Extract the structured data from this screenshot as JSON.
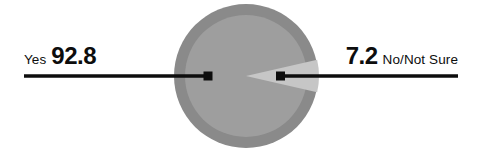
{
  "chart_data": {
    "type": "pie",
    "title": "",
    "categories": [
      "Yes",
      "No/Not Sure"
    ],
    "values": [
      92.8,
      7.2
    ],
    "value_labels": [
      "92.8",
      "7.2"
    ],
    "units": "percent",
    "legend": "none",
    "grid": false,
    "series": [
      {
        "name": "Response share",
        "values": [
          92.8,
          7.2
        ]
      }
    ],
    "slices": [
      {
        "label": "Yes",
        "value": 92.8,
        "value_label": "92.8",
        "color": "#9e9e9e",
        "ring_color": "#8a8a8a",
        "start_angle_deg": 13,
        "end_angle_deg": 347
      },
      {
        "label": "No/Not Sure",
        "value": 7.2,
        "value_label": "7.2",
        "color": "#c6c6c6",
        "ring_color": "#8a8a8a",
        "start_angle_deg": -13,
        "end_angle_deg": 13
      }
    ]
  },
  "labels": {
    "left": {
      "category": "Yes",
      "value": "92.8"
    },
    "right": {
      "value": "7.2",
      "category": "No/Not Sure"
    }
  },
  "colors": {
    "background": "#ffffff",
    "ring": "#8a8a8a",
    "major_slice": "#9e9e9e",
    "minor_slice": "#c6c6c6",
    "leader_line": "#0d0d0d",
    "text": "#0d0d0d"
  }
}
